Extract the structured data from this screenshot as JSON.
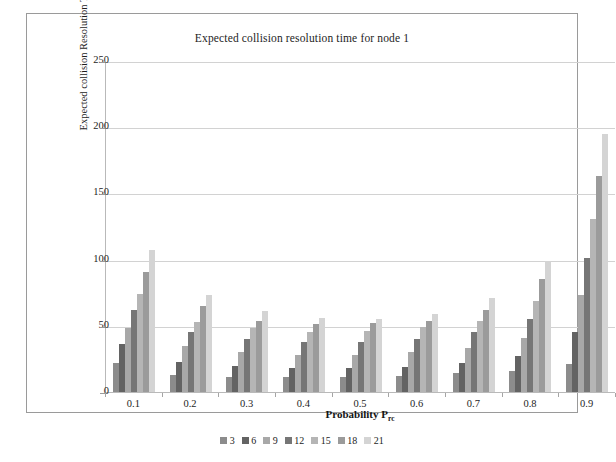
{
  "figure": {
    "title": "Expected collision resolution time for node 1",
    "caption_partial": ""
  },
  "chart_data": {
    "type": "bar",
    "title": "Expected collision resolution time for node 1",
    "xlabel_main": "Probability P",
    "xlabel_sub": "rc",
    "ylabel": "Expected collision Resolution Time (in Milliseconds)",
    "categories": [
      "0.1",
      "0.2",
      "0.3",
      "0.4",
      "0.5",
      "0.6",
      "0.7",
      "0.8",
      "0.9"
    ],
    "ylim": [
      0,
      250
    ],
    "yticks": [
      0,
      50,
      100,
      150,
      200,
      250
    ],
    "grid": true,
    "legend_position": "bottom",
    "series": [
      {
        "name": "3",
        "color": "#8c8c8c",
        "values": [
          22,
          13,
          11,
          11,
          11,
          12,
          14,
          16,
          21
        ]
      },
      {
        "name": "6",
        "color": "#636363",
        "values": [
          36,
          23,
          20,
          18,
          18,
          19,
          22,
          27,
          45
        ]
      },
      {
        "name": "9",
        "color": "#a8a8a8",
        "values": [
          48,
          35,
          30,
          28,
          28,
          30,
          33,
          41,
          73
        ]
      },
      {
        "name": "12",
        "color": "#767676",
        "values": [
          62,
          45,
          40,
          38,
          38,
          40,
          45,
          55,
          101
        ]
      },
      {
        "name": "15",
        "color": "#b5b5b5",
        "values": [
          74,
          53,
          48,
          45,
          46,
          49,
          54,
          69,
          131
        ]
      },
      {
        "name": "18",
        "color": "#9b9b9b",
        "values": [
          91,
          65,
          54,
          51,
          52,
          54,
          62,
          85,
          163
        ]
      },
      {
        "name": "21",
        "color": "#d4d4d4",
        "values": [
          107,
          73,
          61,
          56,
          55,
          59,
          71,
          99,
          195
        ]
      }
    ]
  }
}
